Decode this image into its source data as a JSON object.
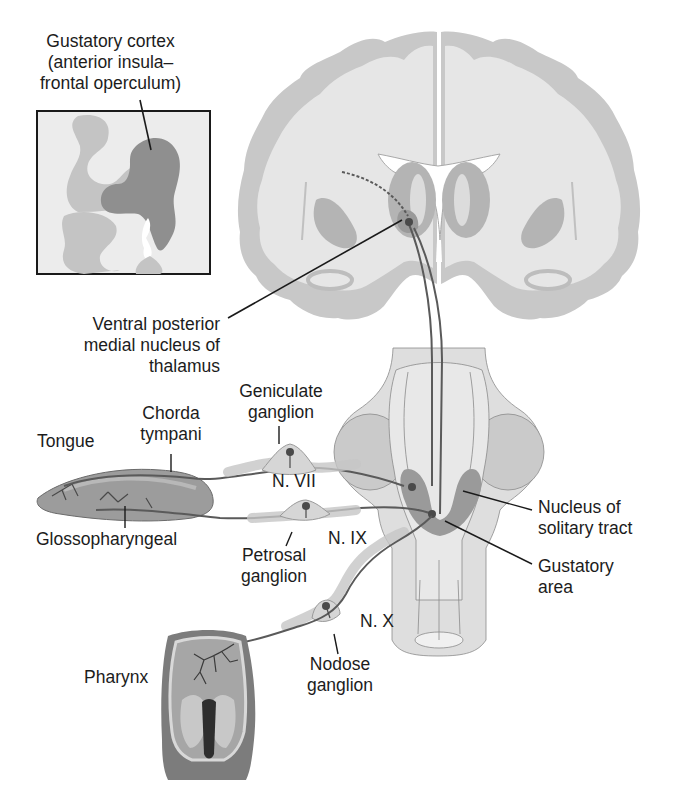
{
  "figure": {
    "colors": {
      "background": "#ffffff",
      "white_matter": "#e6e6e6",
      "gray_matter": "#c4c4c4",
      "deep_nuclei": "#b4b4b4",
      "highlight_region": "#8f8f8f",
      "nerve_fiber": "#5a5a5a",
      "label_line": "#1a1a1a",
      "tongue_fill": "#9c9c9c",
      "pharynx_fill": "#8a8a8a"
    }
  },
  "labels": {
    "gustatory_cortex": [
      "Gustatory cortex",
      "(anterior insula–",
      "frontal operculum)"
    ],
    "vpm_thalamus": [
      "Ventral posterior",
      "medial nucleus of",
      "thalamus"
    ],
    "geniculate_ganglion": [
      "Geniculate",
      "ganglion"
    ],
    "chorda_tympani": [
      "Chorda",
      "tympani"
    ],
    "tongue": [
      "Tongue"
    ],
    "n_vii": [
      "N. VII"
    ],
    "glossopharyngeal": [
      "Glossopharyngeal"
    ],
    "n_ix": [
      "N. IX"
    ],
    "petrosal_ganglion": [
      "Petrosal",
      "ganglion"
    ],
    "nucleus_solitary_tract": [
      "Nucleus of",
      "solitary tract"
    ],
    "gustatory_area": [
      "Gustatory",
      "area"
    ],
    "n_x": [
      "N. X"
    ],
    "nodose_ganglion": [
      "Nodose",
      "ganglion"
    ],
    "pharynx": [
      "Pharynx"
    ]
  }
}
